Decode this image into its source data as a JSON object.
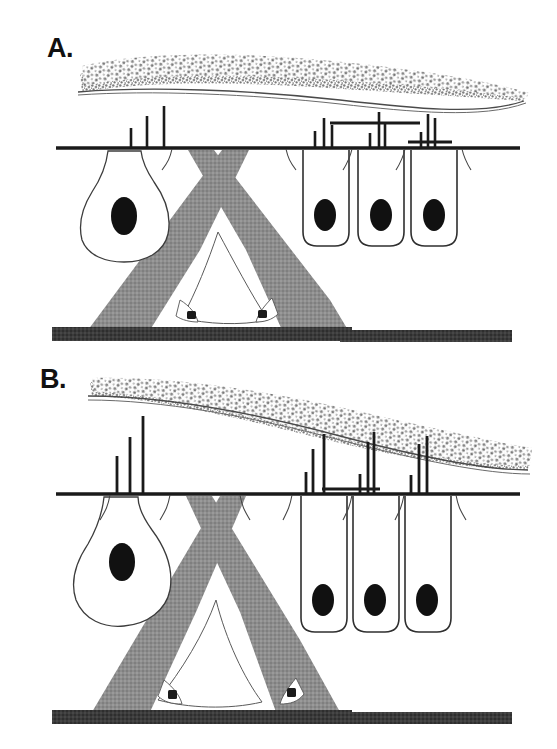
{
  "figure": {
    "background_color": "#ffffff",
    "width": 557,
    "height": 749,
    "ink_color": "#1a1a1a",
    "stipple_color": "#8a8a8a",
    "support_cell_color": "#8c8c8c",
    "basement_color": "#3a3a3a",
    "nucleus_color": "#111111",
    "outline_color": "#333333"
  },
  "panels": [
    {
      "id": "A",
      "label": "A.",
      "label_x": 47,
      "label_y": 35,
      "description": "Resting / low-stimulus condition",
      "baseline_y": 148,
      "baseline_x1": 56,
      "baseline_x2": 520,
      "membrane": {
        "name": "tectorial-membrane",
        "type": "stippled-band",
        "left_x": 78,
        "right_x": 525,
        "top_left_y": 62,
        "top_right_y": 90,
        "thickness_left": 26,
        "thickness_right": 20,
        "taper": "right"
      },
      "receptor_cell": {
        "name": "type-one-hair-cell",
        "shape": "flask",
        "center_x": 124,
        "top_y": 152,
        "bottom_y": 256,
        "width": 86,
        "nucleus_cx": 124,
        "nucleus_cy": 216,
        "nucleus_rx": 13,
        "nucleus_ry": 19
      },
      "columnar_cells": [
        {
          "name": "type-two-hair-cell-1",
          "x": 302,
          "y": 163,
          "w": 46,
          "h": 83,
          "nucleus_cx": 325,
          "nucleus_cy": 215,
          "nucleus_rx": 11,
          "nucleus_ry": 16
        },
        {
          "name": "type-two-hair-cell-2",
          "x": 358,
          "y": 163,
          "w": 46,
          "h": 83,
          "nucleus_cx": 381,
          "nucleus_cy": 215,
          "nucleus_rx": 11,
          "nucleus_ry": 16
        },
        {
          "name": "type-two-hair-cell-3",
          "x": 411,
          "y": 163,
          "w": 46,
          "h": 83,
          "nucleus_cx": 434,
          "nucleus_cy": 215,
          "nucleus_rx": 11,
          "nucleus_ry": 16
        }
      ],
      "support_structure": {
        "name": "supporting-cell-crossing",
        "apex_left_x": 190,
        "apex_right_x": 247,
        "apex_y": 152,
        "base_left_x": 90,
        "base_right_x": 345,
        "base_y": 330
      },
      "basal_cells": [
        {
          "name": "basal-cell-left",
          "cx": 192,
          "cy": 316
        },
        {
          "name": "basal-cell-right",
          "cx": 262,
          "cy": 314
        }
      ],
      "basement_membrane": {
        "name": "basement-membrane",
        "x1": 52,
        "x2": 512,
        "y": 333,
        "thickness": 13
      },
      "spike_trains": [
        {
          "name": "afferent-spike-train-left",
          "baseline_y": 148,
          "spikes": [
            {
              "x": 131,
              "height": 20
            },
            {
              "x": 147,
              "height": 32
            },
            {
              "x": 164,
              "height": 42
            }
          ]
        },
        {
          "name": "afferent-spike-train-right",
          "baseline_y": 148,
          "spikes": [
            {
              "x": 315,
              "height": 17
            },
            {
              "x": 324,
              "height": 30
            },
            {
              "x": 332,
              "height": 23
            },
            {
              "x": 370,
              "height": 15
            },
            {
              "x": 379,
              "height": 36
            },
            {
              "x": 385,
              "height": 26
            },
            {
              "x": 421,
              "height": 16
            },
            {
              "x": 428,
              "height": 34
            },
            {
              "x": 435,
              "height": 30
            }
          ]
        }
      ]
    },
    {
      "id": "B",
      "label": "B.",
      "label_x": 40,
      "label_y": 366,
      "description": "Stimulated / displaced condition with increased firing",
      "baseline_y": 494,
      "baseline_x1": 56,
      "baseline_x2": 520,
      "membrane": {
        "name": "tectorial-membrane",
        "type": "stippled-band",
        "left_x": 86,
        "right_x": 528,
        "top_left_y": 378,
        "top_right_y": 430,
        "thickness_left": 16,
        "thickness_right": 30,
        "taper": "left"
      },
      "receptor_cell": {
        "name": "type-one-hair-cell",
        "shape": "flask",
        "center_x": 122,
        "top_y": 498,
        "bottom_y": 620,
        "width": 86,
        "nucleus_cx": 122,
        "nucleus_cy": 562,
        "nucleus_rx": 13,
        "nucleus_ry": 19
      },
      "columnar_cells": [
        {
          "name": "type-two-hair-cell-1",
          "x": 300,
          "y": 500,
          "w": 46,
          "h": 132,
          "nucleus_cx": 323,
          "nucleus_cy": 600,
          "nucleus_rx": 11,
          "nucleus_ry": 16
        },
        {
          "name": "type-two-hair-cell-2",
          "x": 352,
          "y": 500,
          "w": 46,
          "h": 132,
          "nucleus_cx": 375,
          "nucleus_cy": 600,
          "nucleus_rx": 11,
          "nucleus_ry": 16
        },
        {
          "name": "type-two-hair-cell-3",
          "x": 404,
          "y": 500,
          "w": 46,
          "h": 132,
          "nucleus_cx": 427,
          "nucleus_cy": 600,
          "nucleus_rx": 11,
          "nucleus_ry": 16
        }
      ],
      "support_structure": {
        "name": "supporting-cell-crossing",
        "apex_left_x": 188,
        "apex_right_x": 243,
        "apex_y": 498,
        "base_left_x": 92,
        "base_right_x": 340,
        "base_y": 712
      },
      "basal_cells": [
        {
          "name": "basal-cell-left",
          "cx": 176,
          "cy": 700
        },
        {
          "name": "basal-cell-right",
          "cx": 285,
          "cy": 700
        }
      ],
      "basement_membrane": {
        "name": "basement-membrane",
        "x1": 52,
        "x2": 512,
        "y": 716,
        "thickness": 13
      },
      "spike_trains": [
        {
          "name": "afferent-spike-train-left",
          "baseline_y": 494,
          "spikes": [
            {
              "x": 117,
              "height": 38
            },
            {
              "x": 130,
              "height": 57
            },
            {
              "x": 143,
              "height": 78
            }
          ]
        },
        {
          "name": "afferent-spike-train-right",
          "baseline_y": 494,
          "spikes": [
            {
              "x": 306,
              "height": 22
            },
            {
              "x": 313,
              "height": 45
            },
            {
              "x": 324,
              "height": 60
            },
            {
              "x": 360,
              "height": 20
            },
            {
              "x": 368,
              "height": 52
            },
            {
              "x": 374,
              "height": 62
            },
            {
              "x": 411,
              "height": 19
            },
            {
              "x": 419,
              "height": 50
            },
            {
              "x": 427,
              "height": 58
            }
          ]
        }
      ]
    }
  ]
}
